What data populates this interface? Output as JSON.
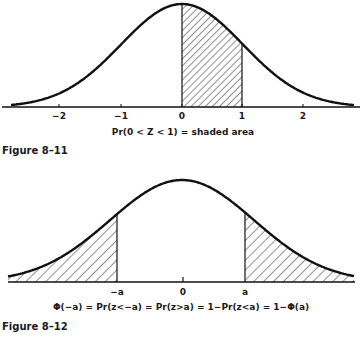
{
  "chart_data": [
    {
      "type": "area",
      "title": "Figure 8-11",
      "curve": "standard normal density",
      "x_ticks": [
        -2,
        -1,
        0,
        1,
        2
      ],
      "x_tick_labels": [
        "−2",
        "−1",
        "0",
        "1",
        "2"
      ],
      "shaded_region": {
        "from": 0,
        "to": 1,
        "pattern": "diagonal hatch"
      },
      "caption": "Pr(0 < Z < 1) = shaded area",
      "xlim": [
        -2.9,
        2.9
      ]
    },
    {
      "type": "area",
      "title": "Figure 8-12",
      "curve": "standard normal density",
      "x_ticks": [
        "-a",
        "0",
        "a"
      ],
      "x_tick_labels": [
        "−a",
        "0",
        "a"
      ],
      "shaded_region": [
        {
          "from": "-inf",
          "to": "-a"
        },
        {
          "from": "a",
          "to": "inf"
        }
      ],
      "caption": "Φ(−a) = Pr(z<−a) = Pr(z>a) = 1−Pr(z<a) = 1−Φ(a)"
    }
  ],
  "fig1": {
    "ticks": [
      "−2",
      "−1",
      "0",
      "1",
      "2"
    ],
    "caption": "Pr(0 < Z < 1) = shaded area",
    "label": "Figure 8–11"
  },
  "fig2": {
    "ticks": [
      "−a",
      "0",
      "a"
    ],
    "caption": "Φ(−a) = Pr(z<−a) = Pr(z>a) = 1−Pr(z<a) = 1−Φ(a)",
    "label": "Figure 8–12"
  }
}
